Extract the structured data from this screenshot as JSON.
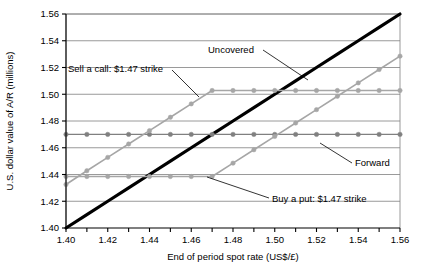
{
  "chart_data": {
    "type": "line",
    "title": "",
    "xlabel": "End of period spot rate (US$/£)",
    "ylabel": "U.S. dollar value of A/R (millions)",
    "xlim": [
      1.4,
      1.56
    ],
    "ylim": [
      1.4,
      1.56
    ],
    "x_tick_step": 0.01,
    "x_label_step": 0.02,
    "y_tick_step": 0.02,
    "grid": "horizontal",
    "legend": "none (inline annotations)",
    "x_tick_labels": [
      "1.40",
      "1.42",
      "1.44",
      "1.46",
      "1.48",
      "1.50",
      "1.52",
      "1.54",
      "1.56"
    ],
    "y_tick_labels": [
      "1.40",
      "1.42",
      "1.44",
      "1.46",
      "1.48",
      "1.50",
      "1.52",
      "1.54",
      "1.56"
    ],
    "x": [
      1.4,
      1.41,
      1.42,
      1.43,
      1.44,
      1.45,
      1.46,
      1.47,
      1.48,
      1.49,
      1.5,
      1.51,
      1.52,
      1.53,
      1.54,
      1.55,
      1.56
    ],
    "series": [
      {
        "name": "Uncovered",
        "color": "#000000",
        "width": 3.2,
        "markers": false,
        "values": [
          1.4,
          1.41,
          1.42,
          1.43,
          1.44,
          1.45,
          1.46,
          1.47,
          1.48,
          1.49,
          1.5,
          1.51,
          1.52,
          1.53,
          1.54,
          1.55,
          1.56
        ]
      },
      {
        "name": "Forward",
        "color": "#808080",
        "width": 1.3,
        "markers": true,
        "values": [
          1.47,
          1.47,
          1.47,
          1.47,
          1.47,
          1.47,
          1.47,
          1.47,
          1.47,
          1.47,
          1.47,
          1.47,
          1.47,
          1.47,
          1.47,
          1.47,
          1.47
        ]
      },
      {
        "name": "Sell a call: $1.47 strike",
        "color": "#a6a6a6",
        "width": 1.6,
        "markers": true,
        "values": [
          1.4325,
          1.4428,
          1.4528,
          1.4628,
          1.4728,
          1.4828,
          1.4928,
          1.5028,
          1.5028,
          1.5028,
          1.5028,
          1.5028,
          1.5028,
          1.5028,
          1.5028,
          1.5028,
          1.5028
        ]
      },
      {
        "name": "Buy a put: $1.47 strike",
        "color": "#a6a6a6",
        "width": 1.6,
        "markers": true,
        "values": [
          1.4385,
          1.4385,
          1.4385,
          1.4385,
          1.4385,
          1.4385,
          1.4385,
          1.4385,
          1.4485,
          1.4585,
          1.4685,
          1.4785,
          1.4885,
          1.4985,
          1.5085,
          1.5185,
          1.5285
        ]
      }
    ],
    "annotations": [
      {
        "name": "sell-a-call",
        "text": "Sell a call: $1.47 strike",
        "text_x": 68,
        "text_y": 72,
        "line": [
          [
            172,
            70
          ],
          [
            199,
            97
          ]
        ]
      },
      {
        "name": "uncovered",
        "text": "Uncovered",
        "text_x": 208,
        "text_y": 53,
        "line": [
          [
            263,
            50
          ],
          [
            308,
            80
          ]
        ]
      },
      {
        "name": "forward",
        "text": "Forward",
        "text_x": 355,
        "text_y": 166,
        "line": [
          [
            352,
            163
          ],
          [
            320,
            143
          ]
        ]
      },
      {
        "name": "buy-a-put",
        "text": "Buy a put: $1.47 strike",
        "text_x": 272,
        "text_y": 202,
        "line": [
          [
            269,
            198
          ],
          [
            207,
            177
          ]
        ]
      }
    ]
  }
}
